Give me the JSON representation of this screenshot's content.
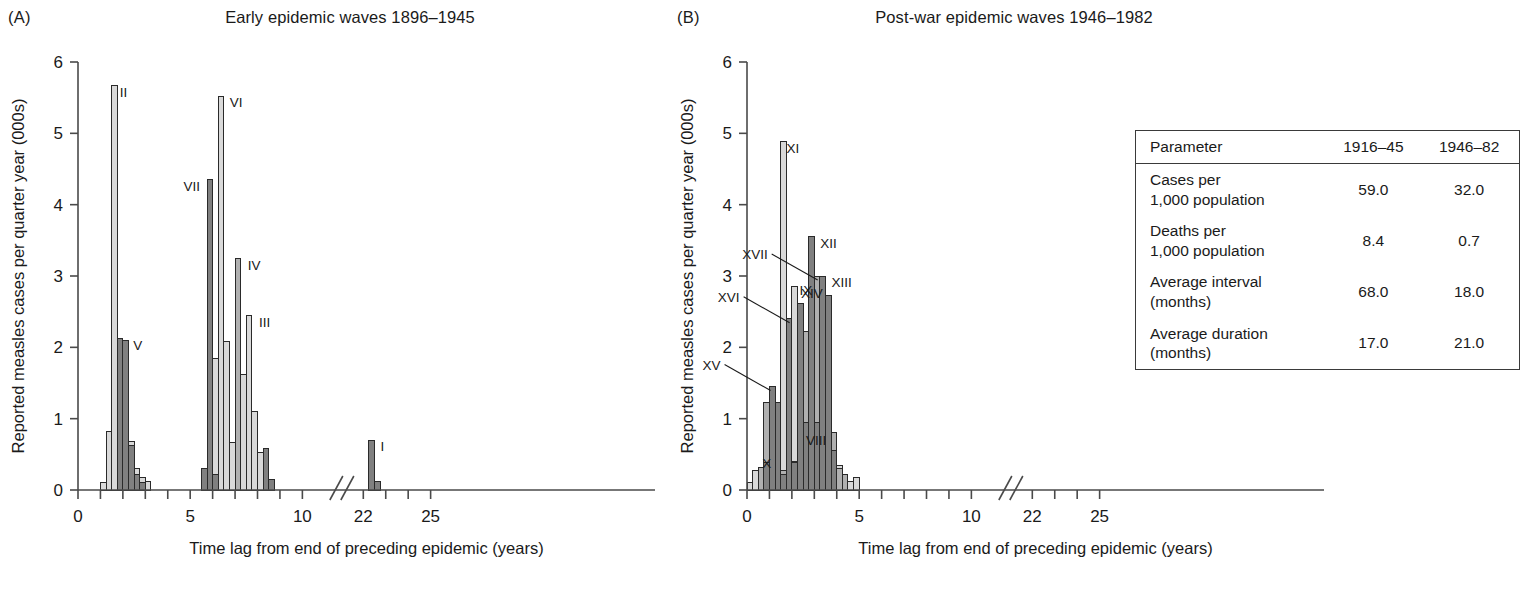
{
  "figure": {
    "x_axis_title": "Time lag from end of preceding epidemic (years)",
    "y_axis_title": "Reported measles cases per quarter year (000s)",
    "x_ticks": [
      "0",
      "5",
      "10",
      "22",
      "25"
    ],
    "y_ticks": [
      "0",
      "1",
      "2",
      "3",
      "4",
      "5",
      "6"
    ],
    "colors": {
      "light": "#d9d9d9",
      "medium": "#b0b0b0",
      "dark": "#808080",
      "outline": "#2a2a2a",
      "axis": "#4a4a4a",
      "text": "#1a1a1a"
    }
  },
  "panel_a": {
    "letter": "(A)",
    "title": "Early epidemic waves 1896–1945"
  },
  "panel_b": {
    "letter": "(B)",
    "title": "Post-war epidemic waves 1946–1982"
  },
  "table": {
    "headers": [
      "Parameter",
      "1916–45",
      "1946–82"
    ],
    "rows": [
      {
        "parameter": "Cases per\n1,000 population",
        "v1": "59.0",
        "v2": "32.0"
      },
      {
        "parameter": "Deaths per\n1,000 population",
        "v1": "8.4",
        "v2": "0.7"
      },
      {
        "parameter": "Average interval\n(months)",
        "v1": "68.0",
        "v2": "18.0"
      },
      {
        "parameter": "Average duration\n(months)",
        "v1": "17.0",
        "v2": "21.0"
      }
    ]
  },
  "chart_data": [
    {
      "id": "panel_a",
      "type": "bar",
      "title": "Early epidemic waves 1896–1945",
      "xlabel": "Time lag from end of preceding epidemic (years)",
      "ylabel": "Reported measles cases per quarter year (000s)",
      "xlim": [
        0,
        25
      ],
      "ylim": [
        0,
        6
      ],
      "axis_break": [
        10.6,
        11.4
      ],
      "bin_width": 0.25,
      "grid": false,
      "legend": "none",
      "annotations": [
        {
          "label": "II",
          "x": 1.55,
          "y": 5.67,
          "anchor": "left"
        },
        {
          "label": "V",
          "x": 2.15,
          "y": 2.12,
          "anchor": "left"
        },
        {
          "label": "VII",
          "x": 5.75,
          "y": 4.35,
          "anchor": "right"
        },
        {
          "label": "VI",
          "x": 6.45,
          "y": 5.52,
          "anchor": "left"
        },
        {
          "label": "IV",
          "x": 7.25,
          "y": 3.24,
          "anchor": "left"
        },
        {
          "label": "III",
          "x": 7.75,
          "y": 2.44,
          "anchor": "left"
        },
        {
          "label": "I",
          "x": 22.45,
          "y": 0.7,
          "anchor": "left"
        }
      ],
      "series": [
        {
          "name": "wave-light",
          "shade": "light",
          "bars": [
            {
              "x": 1.0,
              "value": 0.1
            },
            {
              "x": 1.25,
              "value": 0.82
            },
            {
              "x": 1.5,
              "value": 5.67
            },
            {
              "x": 1.75,
              "value": 0.88
            },
            {
              "x": 2.0,
              "value": 0.7
            },
            {
              "x": 2.25,
              "value": 0.68
            },
            {
              "x": 2.5,
              "value": 0.3
            },
            {
              "x": 2.75,
              "value": 0.18
            },
            {
              "x": 3.0,
              "value": 0.12
            },
            {
              "x": 5.75,
              "value": 0.32
            },
            {
              "x": 6.0,
              "value": 1.85
            },
            {
              "x": 6.25,
              "value": 5.52
            },
            {
              "x": 6.5,
              "value": 2.08
            },
            {
              "x": 6.75,
              "value": 0.66
            },
            {
              "x": 7.0,
              "value": 0.6
            },
            {
              "x": 7.25,
              "value": 1.62
            },
            {
              "x": 7.5,
              "value": 2.44
            },
            {
              "x": 7.75,
              "value": 1.1
            },
            {
              "x": 8.0,
              "value": 0.52
            },
            {
              "x": 8.25,
              "value": 0.3
            },
            {
              "x": 8.5,
              "value": 0.12
            }
          ]
        },
        {
          "name": "wave-medium",
          "shade": "medium",
          "bars": [
            {
              "x": 7.0,
              "value": 3.24
            }
          ]
        },
        {
          "name": "wave-dark",
          "shade": "dark",
          "bars": [
            {
              "x": 1.75,
              "value": 2.12
            },
            {
              "x": 2.0,
              "value": 2.09
            },
            {
              "x": 2.25,
              "value": 0.62
            },
            {
              "x": 2.5,
              "value": 0.22
            },
            {
              "x": 2.75,
              "value": 0.1
            },
            {
              "x": 5.5,
              "value": 0.3
            },
            {
              "x": 5.75,
              "value": 4.35
            },
            {
              "x": 6.0,
              "value": 0.22
            },
            {
              "x": 8.25,
              "value": 0.58
            },
            {
              "x": 8.5,
              "value": 0.15
            },
            {
              "x": 22.25,
              "value": 0.7
            },
            {
              "x": 22.5,
              "value": 0.12
            }
          ]
        }
      ]
    },
    {
      "id": "panel_b",
      "type": "bar",
      "title": "Post-war epidemic waves 1946–1982",
      "xlabel": "Time lag from end of preceding epidemic (years)",
      "ylabel": "Reported measles cases per quarter year (000s)",
      "xlim": [
        0,
        25
      ],
      "ylim": [
        0,
        6
      ],
      "axis_break": [
        10.6,
        11.4
      ],
      "bin_width": 0.25,
      "grid": false,
      "legend": "none",
      "annotations": [
        {
          "label": "XI",
          "x": 1.45,
          "y": 4.88,
          "anchor": "left"
        },
        {
          "label": "XIV",
          "x": 2.1,
          "y": 2.85,
          "anchor": "left"
        },
        {
          "label": "XII",
          "x": 2.95,
          "y": 3.55,
          "anchor": "left"
        },
        {
          "label": "XVII",
          "x": 3.15,
          "y": 3.0,
          "anchor": "leader"
        },
        {
          "label": "XIII",
          "x": 3.45,
          "y": 3.0,
          "anchor": "left"
        },
        {
          "label": "XVI",
          "x": 1.9,
          "y": 2.4,
          "anchor": "leader"
        },
        {
          "label": "XV",
          "x": 1.05,
          "y": 1.45,
          "anchor": "leader"
        },
        {
          "label": "IX",
          "x": 2.45,
          "y": 2.65,
          "anchor": "inside"
        },
        {
          "label": "VIII",
          "x": 2.9,
          "y": 0.55,
          "anchor": "inside"
        },
        {
          "label": "X",
          "x": 0.7,
          "y": 0.22,
          "anchor": "inside"
        }
      ],
      "series": [
        {
          "name": "wave-light",
          "shade": "light",
          "bars": [
            {
              "x": 0.0,
              "value": 0.1
            },
            {
              "x": 0.25,
              "value": 0.28
            },
            {
              "x": 0.75,
              "value": 0.4
            },
            {
              "x": 1.0,
              "value": 0.42
            },
            {
              "x": 1.25,
              "value": 1.22
            },
            {
              "x": 1.5,
              "value": 4.88
            },
            {
              "x": 1.75,
              "value": 0.55
            },
            {
              "x": 2.0,
              "value": 2.85
            },
            {
              "x": 2.25,
              "value": 2.52
            },
            {
              "x": 2.5,
              "value": 1.72
            },
            {
              "x": 2.75,
              "value": 1.02
            },
            {
              "x": 3.0,
              "value": 1.08
            },
            {
              "x": 3.25,
              "value": 0.85
            },
            {
              "x": 3.5,
              "value": 0.8
            },
            {
              "x": 3.75,
              "value": 0.6
            },
            {
              "x": 4.0,
              "value": 0.35
            },
            {
              "x": 4.25,
              "value": 0.2
            },
            {
              "x": 4.5,
              "value": 0.12
            },
            {
              "x": 4.75,
              "value": 0.18
            }
          ]
        },
        {
          "name": "wave-medium",
          "shade": "medium",
          "bars": [
            {
              "x": 0.5,
              "value": 0.32
            },
            {
              "x": 0.75,
              "value": 1.22
            },
            {
              "x": 1.0,
              "value": 1.05
            },
            {
              "x": 1.25,
              "value": 0.42
            },
            {
              "x": 1.5,
              "value": 0.28
            },
            {
              "x": 2.0,
              "value": 0.4
            },
            {
              "x": 2.25,
              "value": 2.52
            },
            {
              "x": 2.5,
              "value": 2.22
            },
            {
              "x": 2.75,
              "value": 2.18
            },
            {
              "x": 3.0,
              "value": 3.0
            },
            {
              "x": 3.25,
              "value": 2.72
            },
            {
              "x": 3.5,
              "value": 1.0
            },
            {
              "x": 3.75,
              "value": 0.8
            },
            {
              "x": 4.0,
              "value": 0.3
            },
            {
              "x": 4.25,
              "value": 0.22
            }
          ]
        },
        {
          "name": "wave-dark",
          "shade": "dark",
          "bars": [
            {
              "x": 0.75,
              "value": 0.38
            },
            {
              "x": 1.0,
              "value": 1.45
            },
            {
              "x": 1.25,
              "value": 1.22
            },
            {
              "x": 1.5,
              "value": 0.22
            },
            {
              "x": 1.75,
              "value": 2.4
            },
            {
              "x": 2.0,
              "value": 0.38
            },
            {
              "x": 2.25,
              "value": 2.62
            },
            {
              "x": 2.5,
              "value": 0.95
            },
            {
              "x": 2.75,
              "value": 3.55
            },
            {
              "x": 3.0,
              "value": 0.95
            },
            {
              "x": 3.25,
              "value": 3.0
            },
            {
              "x": 3.5,
              "value": 2.72
            },
            {
              "x": 3.75,
              "value": 0.55
            }
          ]
        }
      ]
    }
  ]
}
